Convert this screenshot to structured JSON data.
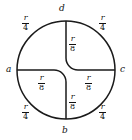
{
  "figure": {
    "type": "geometry-diagram",
    "stroke_color": "#1a1a1a",
    "background_color": "#ffffff",
    "radius_symbol": "r",
    "points": [
      {
        "id": "a",
        "label": "a",
        "position": "left"
      },
      {
        "id": "b",
        "label": "b",
        "position": "bottom"
      },
      {
        "id": "c",
        "label": "c",
        "position": "right"
      },
      {
        "id": "d",
        "label": "d",
        "position": "top"
      }
    ],
    "outer_arc_labels": [
      {
        "id": "arc-ad",
        "numerator": "r",
        "denominator": "4",
        "position": "top-left"
      },
      {
        "id": "arc-dc",
        "numerator": "r",
        "denominator": "4",
        "position": "top-right"
      },
      {
        "id": "arc-ab",
        "numerator": "r",
        "denominator": "4",
        "position": "bottom-left"
      },
      {
        "id": "arc-bc",
        "numerator": "r",
        "denominator": "4",
        "position": "bottom-right"
      }
    ],
    "inner_segment_labels": [
      {
        "id": "seg-top",
        "numerator": "r",
        "denominator": "8",
        "position": "upper-center"
      },
      {
        "id": "seg-left",
        "numerator": "r",
        "denominator": "8",
        "position": "center-left"
      },
      {
        "id": "seg-right",
        "numerator": "r",
        "denominator": "8",
        "position": "center-right"
      },
      {
        "id": "seg-bottom",
        "numerator": "r",
        "denominator": "8",
        "position": "lower-center"
      }
    ]
  }
}
